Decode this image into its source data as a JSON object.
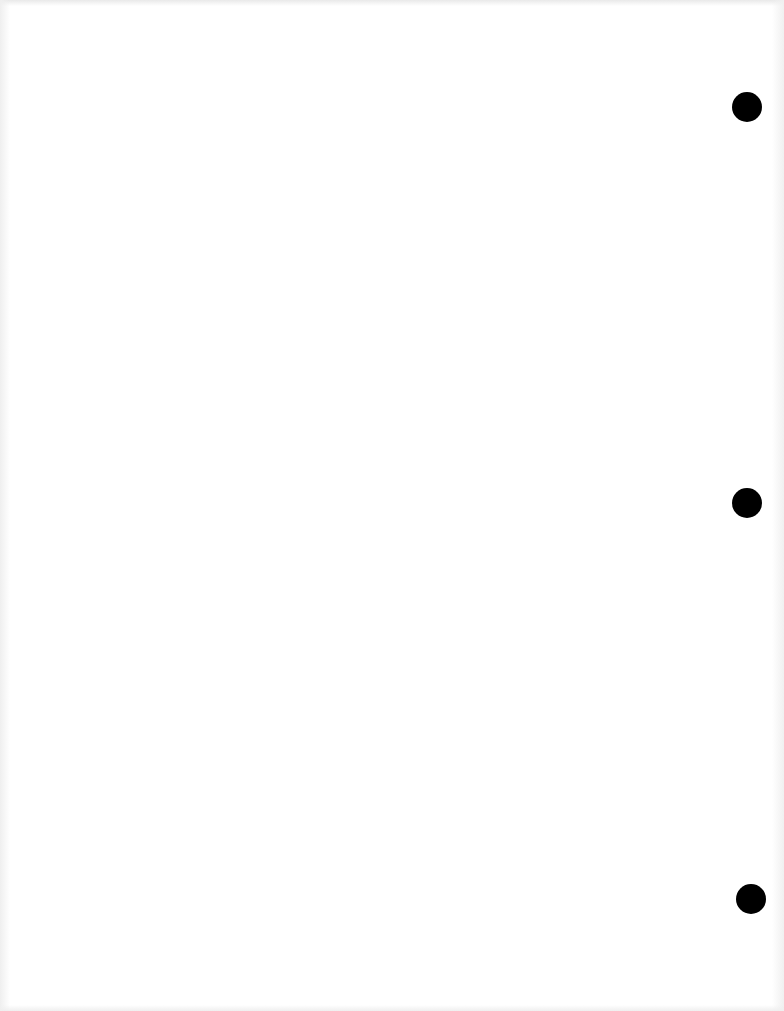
{
  "document": {
    "type": "blank three-hole-punched sheet",
    "background_color": "#ffffff",
    "text_content": ""
  },
  "punch_holes": [
    {
      "cx": 747,
      "cy": 107,
      "diameter": 30,
      "color": "#000000"
    },
    {
      "cx": 747,
      "cy": 503,
      "diameter": 30,
      "color": "#000000"
    },
    {
      "cx": 751,
      "cy": 899,
      "diameter": 30,
      "color": "#000000"
    }
  ]
}
